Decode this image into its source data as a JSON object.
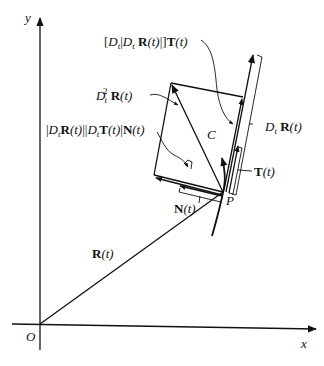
{
  "diagram": {
    "axes": {
      "x_label": "x",
      "y_label": "y",
      "origin_label": "O"
    },
    "labels": {
      "curve": "C",
      "point": "P",
      "position_vector": {
        "bold": "R",
        "arg": "(t)"
      },
      "unit_tangent": {
        "bold": "T",
        "arg": "(t)"
      },
      "unit_normal": {
        "bold": "N",
        "arg": "(t)"
      },
      "velocity": {
        "op": "D",
        "sub": "t",
        "bold": "R",
        "arg": "(t)"
      },
      "acceleration": {
        "op": "D",
        "sub": "t",
        "sup": "2",
        "bold": "R",
        "arg": "(t)"
      },
      "tangential_component": {
        "text_open": "[",
        "op1": "D",
        "sub1": "t",
        "bar": "|",
        "op2": "D",
        "sub2": "t",
        "bold": "R",
        "arg": "(t)",
        "close": "|]",
        "bold2": "T",
        "arg2": "(t)"
      },
      "normal_component": {
        "bar1": "|",
        "op1": "D",
        "sub1": "t",
        "bold1": "R",
        "arg1": "(t)",
        "bar_mid": "||",
        "op2": "D",
        "sub2": "t",
        "bold2": "T",
        "arg2": "(t)",
        "bar_end": "|",
        "bold3": "N",
        "arg3": "(t)"
      }
    }
  }
}
